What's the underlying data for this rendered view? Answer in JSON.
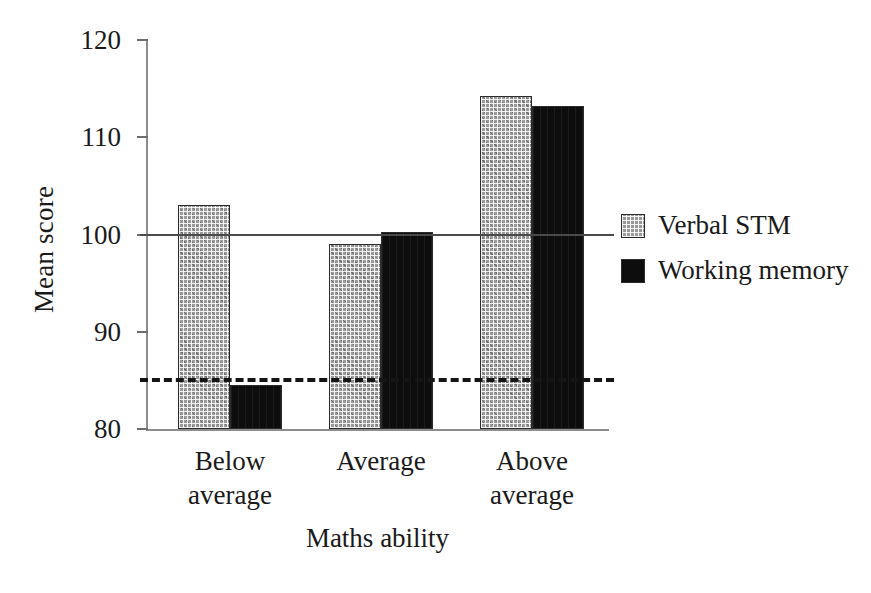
{
  "chart_data": {
    "type": "bar",
    "title": "",
    "subtitle": "",
    "xlabel": "Maths ability",
    "ylabel": "Mean score",
    "categories": [
      "Below average",
      "Average",
      "Above average"
    ],
    "category_lines": [
      [
        "Below",
        "average"
      ],
      [
        "Average",
        ""
      ],
      [
        "Above",
        "average"
      ]
    ],
    "series": [
      {
        "name": "Verbal STM",
        "values": [
          103.0,
          99.0,
          114.2
        ],
        "color": "#9a9a9a",
        "pattern": "checkered-grey"
      },
      {
        "name": "Working memory",
        "values": [
          84.5,
          100.3,
          113.2
        ],
        "color": "#0d0d0d",
        "pattern": "solid-black"
      }
    ],
    "ylim": [
      80,
      120
    ],
    "yticks": [
      120,
      110,
      100,
      90,
      80
    ],
    "ytick_labels": [
      "120",
      "110",
      "100",
      "90",
      "80"
    ],
    "grid": false,
    "legend_position": "right",
    "reference_lines": [
      {
        "name": "population-mean",
        "value": 100,
        "style": "solid",
        "color": "#4a4a4a"
      },
      {
        "name": "lower-reference",
        "value": 85,
        "style": "dashed",
        "color": "#151515"
      }
    ]
  },
  "legend": {
    "entries": [
      {
        "label": "Verbal STM"
      },
      {
        "label": "Working memory"
      }
    ]
  }
}
